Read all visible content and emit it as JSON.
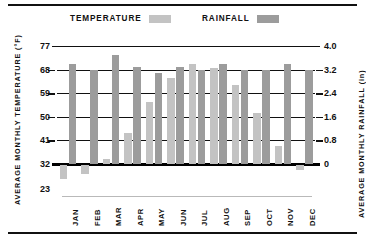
{
  "legend": {
    "temperature_label": "TEMPERATURE",
    "rainfall_label": "RAINFALL",
    "temperature_color": "#c3c3c3",
    "rainfall_color": "#9c9c9c"
  },
  "axes": {
    "left_title": "AVERAGE MONTHLY TEMPERATURE (°F)",
    "right_title": "AVERAGE MONTHLY RAINFALL (in)",
    "left_ticks": [
      "77",
      "68",
      "59",
      "50",
      "41",
      "32",
      "23"
    ],
    "right_ticks": [
      "4.0",
      "3.2",
      "2.4",
      "1.6",
      "0.8",
      "0"
    ]
  },
  "chart_data": {
    "type": "bar",
    "title": "",
    "subtitle": "",
    "xlabel": "",
    "ylabel": "AVERAGE MONTHLY TEMPERATURE (°F)",
    "y2label": "AVERAGE MONTHLY RAINFALL (in)",
    "grid": true,
    "legend_position": "top",
    "categories": [
      "JAN",
      "FEB",
      "MAR",
      "APR",
      "MAY",
      "JUN",
      "JUL",
      "AUG",
      "SEP",
      "OCT",
      "NOV",
      "DEC"
    ],
    "ylim": [
      23,
      77
    ],
    "y2lim": [
      0,
      4.0
    ],
    "yticks": [
      23,
      32,
      41,
      50,
      59,
      68,
      77
    ],
    "y2ticks": [
      0,
      0.8,
      1.6,
      2.4,
      3.2,
      4.0
    ],
    "series": [
      {
        "name": "TEMPERATURE",
        "axis": "left",
        "unit": "°F",
        "color": "#c3c3c3",
        "values": [
          26.5,
          28.5,
          34.0,
          44.0,
          55.5,
          65.0,
          70.0,
          68.5,
          62.0,
          51.5,
          39.0,
          30.0
        ]
      },
      {
        "name": "RAINFALL",
        "axis": "right",
        "unit": "in",
        "color": "#9c9c9c",
        "values": [
          3.4,
          3.2,
          3.7,
          3.3,
          3.1,
          3.3,
          3.2,
          3.4,
          3.2,
          3.2,
          3.4,
          3.2
        ]
      }
    ]
  },
  "months": [
    "JAN",
    "FEB",
    "MAR",
    "APR",
    "MAY",
    "JUN",
    "JUL",
    "AUG",
    "SEP",
    "OCT",
    "NOV",
    "DEC"
  ]
}
